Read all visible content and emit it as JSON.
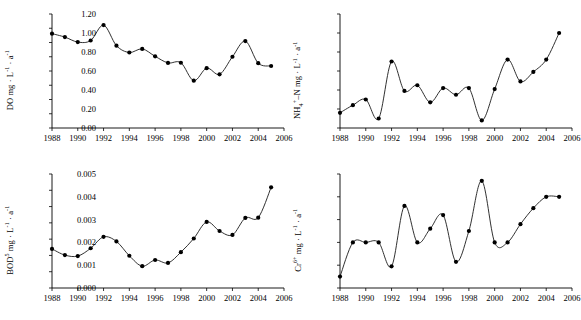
{
  "figure": {
    "panel_count": 4,
    "marker": "filled-circle",
    "line_style": "smooth-curve"
  },
  "chart_data": [
    {
      "id": "do",
      "type": "line",
      "title": "",
      "xlabel": "",
      "ylabel": "DO mg · L⁻¹ · a⁻¹",
      "ylabel_parts": {
        "prefix": "DO mg · L",
        "sup1": "-1",
        "mid": " · a",
        "sup2": "-1"
      },
      "xlim": [
        1988,
        2006
      ],
      "ylim": [
        0.0,
        8.0
      ],
      "xticks": [
        1988,
        1990,
        1992,
        1994,
        1996,
        1998,
        2000,
        2002,
        2004,
        2006
      ],
      "xticklabels": [
        "1988",
        "1990",
        "1992",
        "1994",
        "1996",
        "1998",
        "2000",
        "2002",
        "2004",
        "2006"
      ],
      "yticks": [
        0.0,
        1.0,
        2.0,
        3.0,
        4.0,
        5.0,
        6.0,
        7.0,
        8.0
      ],
      "yticklabels": [
        "0.0",
        "1.0",
        "2.0",
        "3.0",
        "4.0",
        "5.0",
        "6.0",
        "7.0",
        "8.0"
      ],
      "x": [
        1988,
        1989,
        1990,
        1991,
        1992,
        1993,
        1994,
        1995,
        1996,
        1997,
        1998,
        1999,
        2000,
        2001,
        2002,
        2003,
        2004,
        2005
      ],
      "values": [
        6.62,
        6.38,
        6.03,
        6.14,
        7.22,
        5.78,
        5.3,
        5.55,
        5.03,
        4.57,
        4.58,
        3.32,
        4.2,
        3.77,
        5.0,
        6.1,
        4.55,
        4.35
      ],
      "grid": false,
      "legend": "none"
    },
    {
      "id": "nh4n",
      "type": "line",
      "title": "",
      "xlabel": "",
      "ylabel": "NH₄⁺–N mg · L⁻¹ · a⁻¹",
      "ylabel_parts": {
        "prefix": "NH",
        "sub1": "4",
        "sup0": "+",
        "mid0": "–N mg · L",
        "sup1": "-1",
        "mid": " · a",
        "sup2": "-1"
      },
      "xlim": [
        1988,
        2006
      ],
      "ylim": [
        0.0,
        1.2
      ],
      "xticks": [
        1988,
        1990,
        1992,
        1994,
        1996,
        1998,
        2000,
        2002,
        2004,
        2006
      ],
      "xticklabels": [
        "1988",
        "1990",
        "1992",
        "1994",
        "1996",
        "1998",
        "2000",
        "2002",
        "2004",
        "2006"
      ],
      "yticks": [
        0.0,
        0.2,
        0.4,
        0.6,
        0.8,
        1.0,
        1.2
      ],
      "yticklabels": [
        "0.00",
        "0.20",
        "0.40",
        "0.60",
        "0.80",
        "1.00",
        "1.20"
      ],
      "x": [
        1988,
        1989,
        1990,
        1991,
        1992,
        1993,
        1994,
        1995,
        1996,
        1997,
        1998,
        1999,
        2000,
        2001,
        2002,
        2003,
        2004,
        2005
      ],
      "values": [
        0.16,
        0.24,
        0.3,
        0.1,
        0.7,
        0.39,
        0.45,
        0.27,
        0.42,
        0.35,
        0.42,
        0.08,
        0.41,
        0.72,
        0.49,
        0.59,
        0.72,
        1.0
      ],
      "grid": false,
      "legend": "none"
    },
    {
      "id": "bod5",
      "type": "line",
      "title": "",
      "xlabel": "",
      "ylabel": "BOD⁵ mg · L⁻¹ · a⁻¹",
      "ylabel_parts": {
        "prefix": "BOD",
        "sup0": "5",
        "mid0": " mg · L",
        "sup1": "-1",
        "mid": " · a",
        "sup2": "-1"
      },
      "xlim": [
        1988,
        2006
      ],
      "ylim": [
        0.0,
        3.5
      ],
      "xticks": [
        1988,
        1990,
        1992,
        1994,
        1996,
        1998,
        2000,
        2002,
        2004,
        2006
      ],
      "xticklabels": [
        "1988",
        "1990",
        "1992",
        "1994",
        "1996",
        "1998",
        "2000",
        "2002",
        "2004",
        "2006"
      ],
      "yticks": [
        0.0,
        0.5,
        1.0,
        1.5,
        2.0,
        2.5,
        3.0,
        3.5
      ],
      "yticklabels": [
        "0.00",
        "0.50",
        "1.00",
        "1.50",
        "2.00",
        "2.50",
        "3.00",
        "3.50"
      ],
      "x": [
        1988,
        1989,
        1990,
        1991,
        1992,
        1993,
        1994,
        1995,
        1996,
        1997,
        1998,
        1999,
        2000,
        2001,
        2002,
        2003,
        2004,
        2005
      ],
      "values": [
        1.2,
        1.01,
        0.98,
        1.22,
        1.57,
        1.43,
        0.99,
        0.67,
        0.86,
        0.77,
        1.1,
        1.52,
        2.03,
        1.75,
        1.63,
        2.15,
        2.16,
        3.09
      ],
      "grid": false,
      "legend": "none"
    },
    {
      "id": "cr6",
      "type": "line",
      "title": "",
      "xlabel": "",
      "ylabel": "Cr⁶⁺ mg · L⁻¹ · a⁻¹",
      "ylabel_parts": {
        "prefix": "Cr",
        "sup0": "6+",
        "mid0": " mg · L",
        "sup1": "-1",
        "mid": " · a",
        "sup2": "-1"
      },
      "xlim": [
        1988,
        2006
      ],
      "ylim": [
        0.0,
        0.005
      ],
      "xticks": [
        1988,
        1990,
        1992,
        1994,
        1996,
        1998,
        2000,
        2002,
        2004,
        2006
      ],
      "xticklabels": [
        "1988",
        "1990",
        "1992",
        "1994",
        "1996",
        "1998",
        "2000",
        "2002",
        "2004",
        "2006"
      ],
      "yticks": [
        0.0,
        0.001,
        0.002,
        0.003,
        0.004,
        0.005
      ],
      "yticklabels": [
        "0.000",
        "0.001",
        "0.002",
        "0.003",
        "0.004",
        "0.005"
      ],
      "x": [
        1988,
        1989,
        1990,
        1991,
        1992,
        1993,
        1994,
        1995,
        1996,
        1997,
        1998,
        1999,
        2000,
        2001,
        2002,
        2003,
        2004,
        2005
      ],
      "values": [
        0.0005,
        0.002,
        0.002,
        0.002,
        0.00095,
        0.0036,
        0.002,
        0.0026,
        0.0032,
        0.00115,
        0.0025,
        0.0047,
        0.002,
        0.002,
        0.0028,
        0.0035,
        0.004,
        0.004
      ],
      "grid": false,
      "legend": "none"
    }
  ]
}
